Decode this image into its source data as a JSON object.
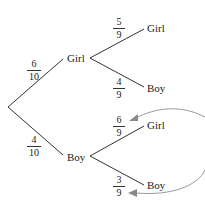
{
  "tree": {
    "level1": [
      {
        "label": "Girl",
        "prob": {
          "num": "6",
          "den": "10"
        }
      },
      {
        "label": "Boy",
        "prob": {
          "num": "4",
          "den": "10"
        }
      }
    ],
    "level2": [
      {
        "parent": "Girl",
        "label": "Girl",
        "prob": {
          "num": "5",
          "den": "9"
        }
      },
      {
        "parent": "Girl",
        "label": "Boy",
        "prob": {
          "num": "4",
          "den": "9"
        }
      },
      {
        "parent": "Boy",
        "label": "Girl",
        "prob": {
          "num": "6",
          "den": "9"
        }
      },
      {
        "parent": "Boy",
        "label": "Boy",
        "prob": {
          "num": "3",
          "den": "9"
        }
      }
    ]
  },
  "annotations": {
    "arrow_color": "#9a9a9a",
    "line_color": "#333333"
  }
}
